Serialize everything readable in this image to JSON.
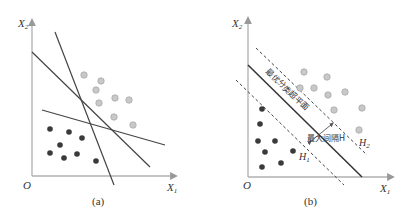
{
  "figure": {
    "panels": [
      {
        "id": "a",
        "caption": "(a)",
        "axis": {
          "x_label": "X",
          "x_sub": "1",
          "y_label": "X",
          "y_sub": "2",
          "origin": "O"
        },
        "description": "Several candidate separating lines between two classes"
      },
      {
        "id": "b",
        "caption": "(b)",
        "axis": {
          "x_label": "X",
          "x_sub": "1",
          "y_label": "X",
          "y_sub": "2",
          "origin": "O"
        },
        "annotations": {
          "hyperplane": "最优分类超平面",
          "margin": "最大间隔H",
          "h1": "H",
          "h1_sub": "1",
          "h2": "H",
          "h2_sub": "2"
        }
      }
    ],
    "colors": {
      "axis": "#b0b0b0",
      "line": "#444444",
      "dark_point": "#3a3a3a",
      "light_point": "#c8c8c8",
      "light_point_stroke": "#a8a8a8",
      "text": "#333333"
    }
  }
}
